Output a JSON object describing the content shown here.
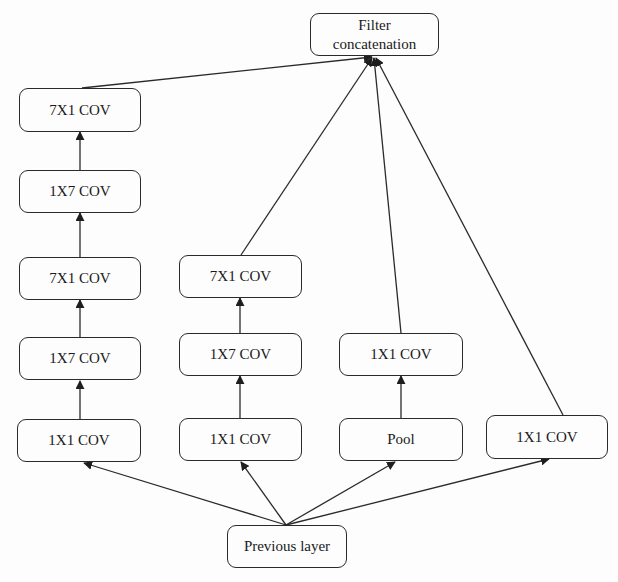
{
  "diagram": {
    "type": "flowchart",
    "concat": {
      "label_line1": "Filter",
      "label_line2": "concatenation"
    },
    "input": {
      "label": "Previous layer"
    },
    "branches": [
      {
        "id": "b1",
        "layers": [
          "1X1 COV",
          "1X7 COV",
          "7X1 COV",
          "1X7 COV",
          "7X1 COV"
        ]
      },
      {
        "id": "b2",
        "layers": [
          "1X1 COV",
          "1X7 COV",
          "7X1 COV"
        ]
      },
      {
        "id": "b3",
        "layers": [
          "Pool",
          "1X1 COV"
        ]
      },
      {
        "id": "b4",
        "layers": [
          "1X1 COV"
        ]
      }
    ],
    "edges": [
      [
        "Previous layer",
        "b1:1X1 COV"
      ],
      [
        "Previous layer",
        "b2:1X1 COV"
      ],
      [
        "Previous layer",
        "b3:Pool"
      ],
      [
        "Previous layer",
        "b4:1X1 COV"
      ],
      [
        "b1:1X1 COV",
        "b1:1X7 COV"
      ],
      [
        "b1:1X7 COV",
        "b1:7X1 COV"
      ],
      [
        "b1:7X1 COV",
        "b1:1X7 COV (2)"
      ],
      [
        "b1:1X7 COV (2)",
        "b1:7X1 COV (2)"
      ],
      [
        "b1:7X1 COV (2)",
        "Filter concatenation"
      ],
      [
        "b2:1X1 COV",
        "b2:1X7 COV"
      ],
      [
        "b2:1X7 COV",
        "b2:7X1 COV"
      ],
      [
        "b2:7X1 COV",
        "Filter concatenation"
      ],
      [
        "b3:Pool",
        "b3:1X1 COV"
      ],
      [
        "b3:1X1 COV",
        "Filter concatenation"
      ],
      [
        "b4:1X1 COV",
        "Filter concatenation"
      ]
    ],
    "colors": {
      "stroke": "#2a2a2a",
      "background": "#fdfdfd",
      "text": "#1a1a1a"
    }
  }
}
